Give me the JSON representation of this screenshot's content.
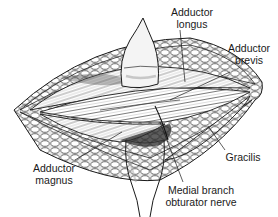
{
  "figure": {
    "type": "anatomical-illustration",
    "colors": {
      "ink": "#1a1a1a",
      "background": "#ffffff",
      "shading": "#8a8a8a",
      "retractor": "#f4f4f4"
    }
  },
  "labels": {
    "adductor_longus": {
      "line1": "Adductor",
      "line2": "longus"
    },
    "adductor_brevis": {
      "line1": "Adductor",
      "line2": "brevis"
    },
    "gracilis": {
      "line1": "Gracilis"
    },
    "adductor_magnus": {
      "line1": "Adductor",
      "line2": "magnus"
    },
    "medial_branch_obturator_nerve": {
      "line1": "Medial branch",
      "line2": "obturator nerve"
    }
  }
}
